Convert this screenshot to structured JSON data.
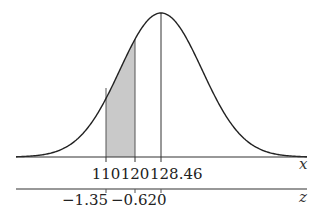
{
  "chart_data": {
    "type": "area",
    "title": "",
    "distribution": {
      "mean": 128.46,
      "shaded_from": 110,
      "shaded_to": 120
    },
    "x_axis": {
      "label": "x",
      "ticks": [
        "110",
        "120",
        "128.46"
      ]
    },
    "z_axis": {
      "label": "z",
      "ticks": [
        "−1.35",
        "−0.62",
        "0"
      ]
    },
    "z_values": [
      -1.35,
      -0.62,
      0
    ],
    "x_values": [
      110,
      120,
      128.46
    ],
    "colors": {
      "curve": "#222222",
      "shade": "#c8c8c8"
    }
  }
}
